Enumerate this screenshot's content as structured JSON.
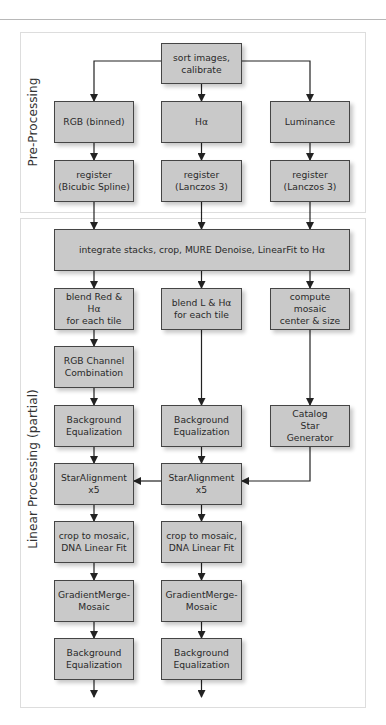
{
  "sections": {
    "pre_processing": "Pre-Processing",
    "linear_processing": "Linear Processing (partial)"
  },
  "nodes": {
    "sort": "sort images,\ncalibrate",
    "rgb": "RGB (binned)",
    "ha": "Hα",
    "lum": "Luminance",
    "reg_rgb": "register\n(Bicubic Spline)",
    "reg_ha": "register\n(Lanczos 3)",
    "reg_lum": "register\n(Lanczos 3)",
    "integrate": "integrate stacks, crop,  MURE Denoise, LinearFit to Hα",
    "blend_red": "blend Red & Hα\nfor each tile",
    "blend_l": "blend L & Hα\nfor each tile",
    "mosaic_center": "compute mosaic\ncenter & size",
    "rgb_combo": "RGB Channel\nCombination",
    "bg_eq_1": "Background\nEqualization",
    "bg_eq_2": "Background\nEqualization",
    "catalog": "Catalog\nStar\nGenerator",
    "star_align_1": "StarAlignment\nx5",
    "star_align_2": "StarAlignment\nx5",
    "crop_1": "crop to mosaic,\nDNA Linear Fit",
    "crop_2": "crop to mosaic,\nDNA Linear Fit",
    "gmm_1": "GradientMerge-\nMosaic",
    "gmm_2": "GradientMerge-\nMosaic",
    "bg_eq_3": "Background\nEqualization",
    "bg_eq_4": "Background\nEqualization"
  },
  "edges": [
    [
      "sort",
      "rgb"
    ],
    [
      "sort",
      "ha"
    ],
    [
      "sort",
      "lum"
    ],
    [
      "rgb",
      "reg_rgb"
    ],
    [
      "ha",
      "reg_ha"
    ],
    [
      "lum",
      "reg_lum"
    ],
    [
      "reg_rgb",
      "integrate"
    ],
    [
      "reg_ha",
      "integrate"
    ],
    [
      "reg_lum",
      "integrate"
    ],
    [
      "integrate",
      "blend_red"
    ],
    [
      "integrate",
      "blend_l"
    ],
    [
      "integrate",
      "mosaic_center"
    ],
    [
      "blend_red",
      "rgb_combo"
    ],
    [
      "rgb_combo",
      "bg_eq_1"
    ],
    [
      "blend_l",
      "bg_eq_2"
    ],
    [
      "mosaic_center",
      "catalog"
    ],
    [
      "bg_eq_1",
      "star_align_1"
    ],
    [
      "bg_eq_2",
      "star_align_2"
    ],
    [
      "catalog",
      "star_align_2"
    ],
    [
      "star_align_2",
      "star_align_1"
    ],
    [
      "star_align_1",
      "crop_1"
    ],
    [
      "star_align_2",
      "crop_2"
    ],
    [
      "crop_1",
      "gmm_1"
    ],
    [
      "crop_2",
      "gmm_2"
    ],
    [
      "gmm_1",
      "bg_eq_3"
    ],
    [
      "gmm_2",
      "bg_eq_4"
    ],
    [
      "bg_eq_3",
      "out"
    ],
    [
      "bg_eq_4",
      "out"
    ]
  ],
  "colors": {
    "node_fill": "#c9c9c9",
    "node_border": "#454545",
    "edge": "#222222"
  }
}
